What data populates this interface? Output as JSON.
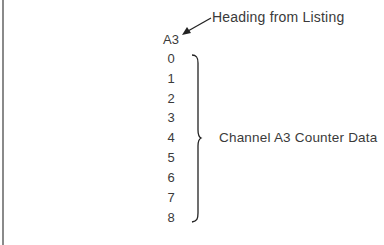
{
  "callout": {
    "heading": "Heading from Listing",
    "arrow_icon": "arrow-pointing-to-channel-label"
  },
  "column": {
    "label": "A3",
    "rows": [
      "0",
      "1",
      "2",
      "3",
      "4",
      "5",
      "6",
      "7",
      "8"
    ]
  },
  "annotation": {
    "text": "Channel A3 Counter Data",
    "bracket_icon": "curly-brace"
  }
}
